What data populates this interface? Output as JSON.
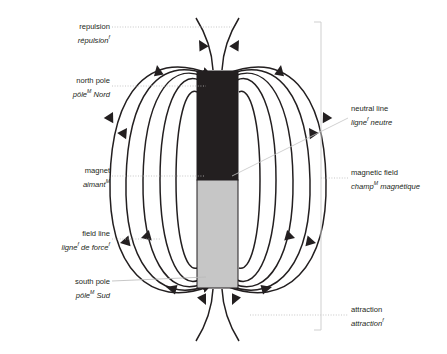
{
  "diagram": {
    "colors": {
      "north_pole_fill": "#231f20",
      "south_pole_fill": "#c6c6c6",
      "field_line_stroke": "#231f20",
      "leader_line": "#b5b5b5",
      "bracket_line": "#cfcfcf",
      "text": "#231f20",
      "background": "#ffffff"
    },
    "magnet": {
      "x": 197,
      "y": 71,
      "width": 41,
      "height": 217,
      "neutral_line_y": 180
    },
    "bracket": {
      "x": 321,
      "y_top": 22,
      "y_bottom": 330
    }
  },
  "labels": {
    "repulsion": {
      "en": "repulsion",
      "fr": "répulsion",
      "fr_gender": "f",
      "side": "left",
      "x": 28,
      "y": 22,
      "width": 82
    },
    "north_pole": {
      "en": "north pole",
      "fr": "pôle",
      "fr_gender": "M",
      "fr_rest": " Nord",
      "side": "left",
      "x": 28,
      "y": 76,
      "width": 82
    },
    "magnet": {
      "en": "magnet",
      "fr": "aimant",
      "fr_gender": "M",
      "side": "left",
      "x": 28,
      "y": 166,
      "width": 82
    },
    "field_line": {
      "en": "field line",
      "fr": "ligne",
      "fr_gender": "f",
      "fr_rest": " de force",
      "fr_gender2": "f",
      "side": "left",
      "x": 14,
      "y": 229,
      "width": 96
    },
    "south_pole": {
      "en": "south pole",
      "fr": "pôle",
      "fr_gender": "M",
      "fr_rest": " Sud",
      "side": "left",
      "x": 28,
      "y": 277,
      "width": 82
    },
    "neutral_line": {
      "en": "neutral line",
      "fr": "ligne",
      "fr_gender": "f",
      "fr_rest": " neutre",
      "side": "right",
      "x": 351,
      "y": 104
    },
    "magnetic_field": {
      "en": "magnetic field",
      "fr": "champ",
      "fr_gender": "M",
      "fr_rest": " magnétique",
      "side": "right",
      "x": 351,
      "y": 168
    },
    "attraction": {
      "en": "attraction",
      "fr": "attraction",
      "fr_gender": "f",
      "side": "right",
      "x": 351,
      "y": 305
    }
  }
}
